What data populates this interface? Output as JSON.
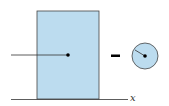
{
  "diagram": {
    "axis_label": "x",
    "operator": "−",
    "colors": {
      "fill": "#bcdcef",
      "stroke": "#333333",
      "point": "#000000"
    },
    "shapes": [
      {
        "type": "rectangle",
        "role": "base-area"
      },
      {
        "type": "circle",
        "role": "subtracted-area",
        "has_radius_line": true
      }
    ]
  }
}
